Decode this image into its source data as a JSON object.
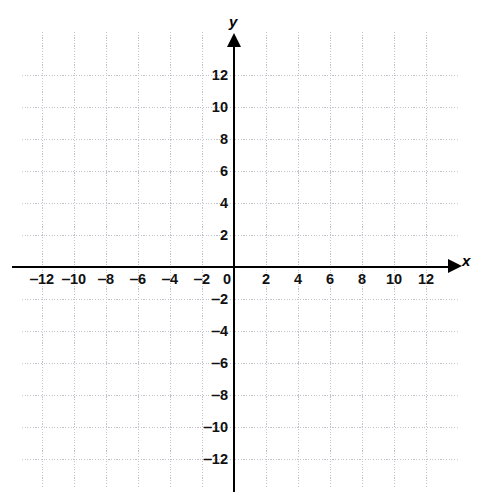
{
  "figure": {
    "type": "coordinate-plane",
    "title": "",
    "background_color": "#ffffff",
    "axis_color": "#000000",
    "grid_color": "#c3c3cc",
    "label_color": "#111111"
  },
  "axes": {
    "x_name": "x",
    "y_name": "y",
    "origin_label": "0"
  },
  "chart_data": {
    "type": "scatter",
    "title": "",
    "xlabel": "x",
    "ylabel": "y",
    "xlim": [
      -13.5,
      13.5
    ],
    "ylim": [
      -13.5,
      13.5
    ],
    "xticks": [
      -12,
      -10,
      -8,
      -6,
      -4,
      -2,
      0,
      2,
      4,
      6,
      8,
      10,
      12
    ],
    "yticks": [
      -12,
      -10,
      -8,
      -6,
      -4,
      -2,
      2,
      4,
      6,
      8,
      10,
      12
    ],
    "xtick_labels": [
      "‒12",
      "‒10",
      "‒8",
      "‒6",
      "‒4",
      "‒2",
      "0",
      "2",
      "4",
      "6",
      "8",
      "10",
      "12"
    ],
    "ytick_labels": [
      "‒12",
      "‒10",
      "‒8",
      "‒6",
      "‒4",
      "‒2",
      "2",
      "4",
      "6",
      "8",
      "10",
      "12"
    ],
    "grid": true,
    "grid_interval": 2,
    "legend": null,
    "series": [],
    "annotations": [],
    "values": [],
    "categories": []
  },
  "x_tick_labels": [
    {
      "text": "‒12",
      "value": -12
    },
    {
      "text": "‒10",
      "value": -10
    },
    {
      "text": "‒8",
      "value": -8
    },
    {
      "text": "‒6",
      "value": -6
    },
    {
      "text": "‒4",
      "value": -4
    },
    {
      "text": "‒2",
      "value": -2
    },
    {
      "text": "2",
      "value": 2
    },
    {
      "text": "4",
      "value": 4
    },
    {
      "text": "6",
      "value": 6
    },
    {
      "text": "8",
      "value": 8
    },
    {
      "text": "10",
      "value": 10
    },
    {
      "text": "12",
      "value": 12
    }
  ],
  "y_tick_labels": [
    {
      "text": "12",
      "value": 12
    },
    {
      "text": "10",
      "value": 10
    },
    {
      "text": "8",
      "value": 8
    },
    {
      "text": "6",
      "value": 6
    },
    {
      "text": "4",
      "value": 4
    },
    {
      "text": "2",
      "value": 2
    },
    {
      "text": "‒2",
      "value": -2
    },
    {
      "text": "‒4",
      "value": -4
    },
    {
      "text": "‒6",
      "value": -6
    },
    {
      "text": "‒8",
      "value": -8
    },
    {
      "text": "‒10",
      "value": -10
    },
    {
      "text": "‒12",
      "value": -12
    }
  ],
  "gridlines": {
    "horizontal_values": [
      12,
      10,
      8,
      6,
      4,
      2,
      -2,
      -4,
      -6,
      -8,
      -10,
      -12
    ],
    "vertical_values": [
      -12,
      -10,
      -8,
      -6,
      -4,
      -2,
      2,
      4,
      6,
      8,
      10,
      12
    ]
  }
}
